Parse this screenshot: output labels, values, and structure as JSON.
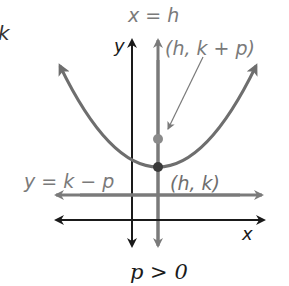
{
  "diagram": {
    "type": "parabola-opening-up",
    "colors": {
      "axes": "#1a1a1a",
      "feature": "#7a7a7a",
      "parabola": "#6e6e6e",
      "vertex": "#3a3a3a",
      "focus": "#8a8a8a"
    },
    "labels": {
      "partial_left": "k",
      "axis_of_symmetry": "x = h",
      "y_axis": "y",
      "x_axis": "x",
      "focus": "(h, k + p)",
      "vertex": "(h, k)",
      "directrix": "y = k − p",
      "caption": "p > 0"
    },
    "points": {
      "vertex": {
        "name": "vertex",
        "label": "(h, k)"
      },
      "focus": {
        "name": "focus",
        "label": "(h, k + p)"
      }
    }
  }
}
